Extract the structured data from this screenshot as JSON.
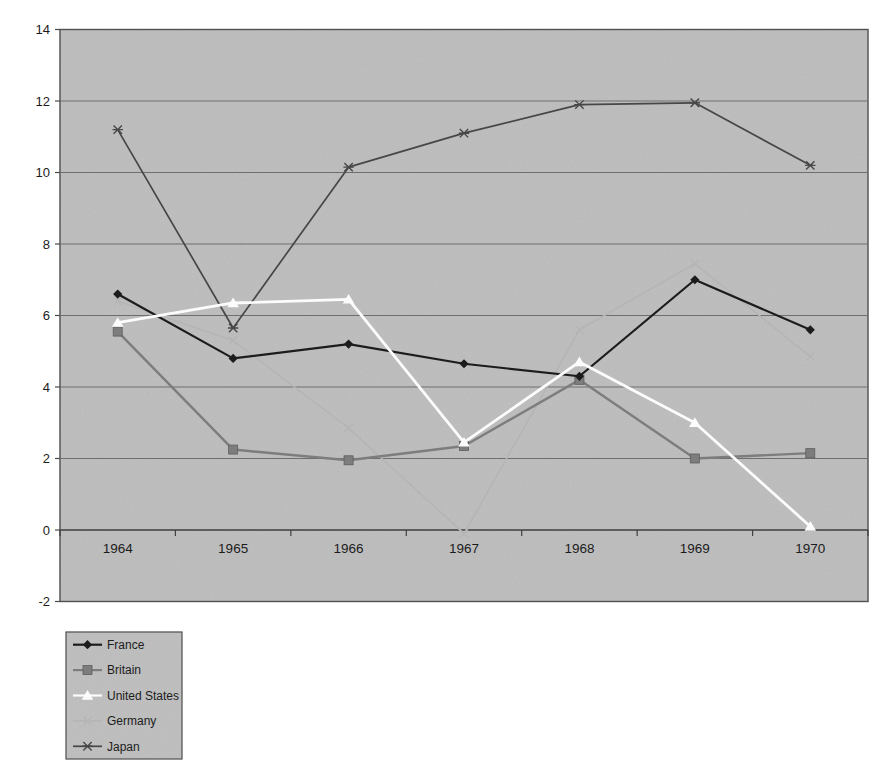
{
  "chart_data": {
    "type": "line",
    "title": "",
    "xlabel": "",
    "ylabel": "",
    "x_tick_labels": [
      "1964",
      "1965",
      "1966",
      "1967",
      "1968",
      "1969",
      "1970"
    ],
    "y_tick_labels": [
      "14",
      "12",
      "10",
      "8",
      "6",
      "4",
      "2",
      "0",
      "-2"
    ],
    "yticks": [
      14,
      12,
      10,
      8,
      6,
      4,
      2,
      0,
      -2
    ],
    "ylim": [
      -2,
      14
    ],
    "grid": true,
    "legend_position": "bottom-left-outside",
    "series": [
      {
        "name": "France",
        "marker": "diamond",
        "color": "#1c1c1c",
        "line_width": 2.2,
        "values": [
          6.6,
          4.8,
          5.2,
          4.65,
          4.3,
          7.0,
          5.6
        ]
      },
      {
        "name": "Britain",
        "marker": "square",
        "color": "#7d7d7d",
        "line_width": 2.4,
        "values": [
          5.55,
          2.25,
          1.95,
          2.35,
          4.2,
          2.0,
          2.15
        ]
      },
      {
        "name": "United States",
        "marker": "triangle",
        "color": "#fcfcfc",
        "line_width": 2.8,
        "values": [
          5.8,
          6.35,
          6.45,
          2.45,
          4.7,
          3.0,
          0.1
        ]
      },
      {
        "name": "Germany",
        "marker": "x",
        "color": "#b5b5b5",
        "line_width": 1.6,
        "values": [
          6.4,
          5.3,
          2.85,
          -0.1,
          5.6,
          7.45,
          4.85
        ]
      },
      {
        "name": "Japan",
        "marker": "star",
        "color": "#474747",
        "line_width": 1.7,
        "values": [
          11.2,
          5.65,
          10.15,
          11.1,
          11.9,
          11.95,
          10.2
        ]
      }
    ],
    "draw_order": [
      "Germany",
      "Britain",
      "Japan",
      "France",
      "United States"
    ],
    "colors": {
      "plot_bg": "#c9c9c9",
      "page_bg": "#ffffff",
      "border": "#4a4a4a",
      "gridline": "#6e6e6e",
      "axis_line": "#3f3f3f",
      "text": "#1c1c1c"
    }
  },
  "legend": {
    "items": [
      "France",
      "Britain",
      "United States",
      "Germany",
      "Japan"
    ]
  }
}
